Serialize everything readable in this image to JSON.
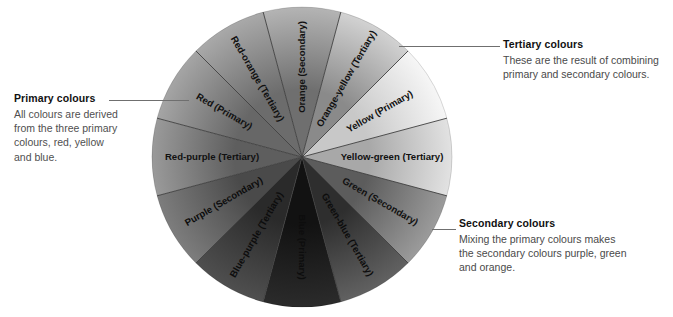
{
  "diagram": {
    "type": "radial-segment-wheel",
    "center": {
      "x": 302,
      "y": 157
    },
    "radius": 150,
    "segment_count": 12
  },
  "wheel": {
    "segments": [
      {
        "name": "Orange (Secondary)",
        "label": "Orange (Secondary)",
        "category": "Secondary",
        "angle_start": -105,
        "angle_end": -75,
        "fill_inner": "#6f6f6f",
        "fill_outer": "#b4b4b4"
      },
      {
        "name": "Orange-yellow (Tertiary)",
        "label": "Orange-yellow (Tertiary)",
        "category": "Tertiary",
        "angle_start": -75,
        "angle_end": -45,
        "fill_inner": "#8a8a8a",
        "fill_outer": "#d2d2d2"
      },
      {
        "name": "Yellow (Primary)",
        "label": "Yellow (Primary)",
        "category": "Primary",
        "angle_start": -45,
        "angle_end": -15,
        "fill_inner": "#c8c8c8",
        "fill_outer": "#f6f6f6"
      },
      {
        "name": "Yellow-green (Tertiary)",
        "label": "Yellow-green (Tertiary)",
        "category": "Tertiary",
        "angle_start": -15,
        "angle_end": 15,
        "fill_inner": "#a8a8a8",
        "fill_outer": "#e2e2e2"
      },
      {
        "name": "Green (Secondary)",
        "label": "Green (Secondary)",
        "category": "Secondary",
        "angle_start": 15,
        "angle_end": 45,
        "fill_inner": "#5c5c5c",
        "fill_outer": "#9b9b9b"
      },
      {
        "name": "Green-blue (Tertiary)",
        "label": "Green-blue (Tertiary)",
        "category": "Tertiary",
        "angle_start": 45,
        "angle_end": 75,
        "fill_inner": "#2e2e2e",
        "fill_outer": "#616161"
      },
      {
        "name": "Blue (Primary)",
        "label": "Blue (Primary)",
        "category": "Primary",
        "angle_start": 75,
        "angle_end": 105,
        "fill_inner": "#121212",
        "fill_outer": "#2b2b2b"
      },
      {
        "name": "Blue-purple (Tertiary)",
        "label": "Blue-purple (Tertiary)",
        "category": "Tertiary",
        "angle_start": 105,
        "angle_end": 135,
        "fill_inner": "#2a2a2a",
        "fill_outer": "#4f4f4f"
      },
      {
        "name": "Purple (Secondary)",
        "label": "Purple (Secondary)",
        "category": "Secondary",
        "angle_start": 135,
        "angle_end": 165,
        "fill_inner": "#4a4a4a",
        "fill_outer": "#7d7d7d"
      },
      {
        "name": "Red-purple (Tertiary)",
        "label": "Red-purple (Tertiary)",
        "category": "Tertiary",
        "angle_start": 165,
        "angle_end": 195,
        "fill_inner": "#5e5e5e",
        "fill_outer": "#9a9a9a"
      },
      {
        "name": "Red (Primary)",
        "label": "Red (Primary)",
        "category": "Primary",
        "angle_start": 195,
        "angle_end": 225,
        "fill_inner": "#676767",
        "fill_outer": "#a5a5a5"
      },
      {
        "name": "Red-orange (Tertiary)",
        "label": "Red-orange (Tertiary)",
        "category": "Tertiary",
        "angle_start": 225,
        "angle_end": 255,
        "fill_inner": "#6c6c6c",
        "fill_outer": "#a9a9a9"
      }
    ],
    "divider_color": "#3d3d3d",
    "label_color": "#111111"
  },
  "callouts": {
    "primary": {
      "title": "Primary colours",
      "body": "All colours are derived from the three primary colours, red, yellow and blue.",
      "body_lines": [
        "All colours are derived",
        "from the three primary",
        "colours, red, yellow",
        "and blue."
      ]
    },
    "tertiary": {
      "title": "Tertiary colours",
      "body": "These are the result of combining primary and secondary colours.",
      "body_lines": [
        "These are the result of combining",
        "primary and secondary colours."
      ]
    },
    "secondary": {
      "title": "Secondary colours",
      "body": "Mixing the primary colours makes the secondary colours purple, green and orange.",
      "body_lines": [
        "Mixing the primary colours makes",
        "the secondary colours purple, green",
        "and orange."
      ]
    }
  },
  "colors": {
    "background": "#ffffff",
    "title_text": "#111111",
    "body_text": "#4f4f4f",
    "leader_line": "#6f6f6f"
  }
}
